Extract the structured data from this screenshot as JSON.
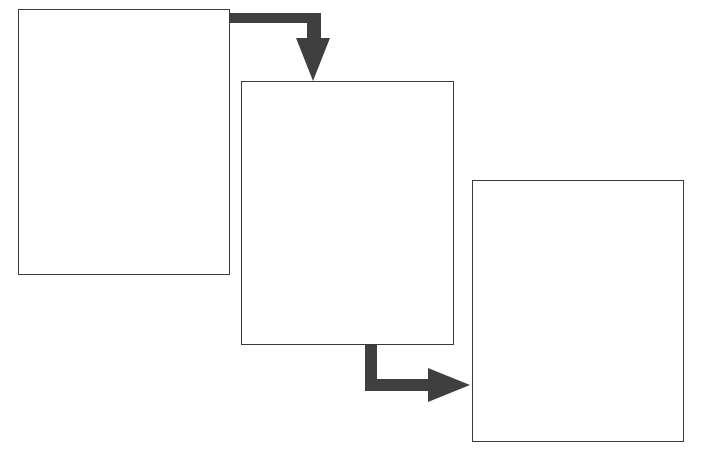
{
  "diagram": {
    "type": "flow",
    "colors": {
      "box_border": "#3a3a3a",
      "arrow": "#3f3f3f",
      "background": "#ffffff"
    },
    "boxes": [
      {
        "id": "box-1",
        "label": "",
        "x": 18,
        "y": 9,
        "w": 212,
        "h": 266
      },
      {
        "id": "box-2",
        "label": "",
        "x": 241,
        "y": 81,
        "w": 213,
        "h": 264
      },
      {
        "id": "box-3",
        "label": "",
        "x": 472,
        "y": 180,
        "w": 212,
        "h": 262
      }
    ],
    "arrows": [
      {
        "from": "box-1",
        "to": "box-2",
        "direction": "right-then-down"
      },
      {
        "from": "box-2",
        "to": "box-3",
        "direction": "down-then-right"
      }
    ]
  }
}
